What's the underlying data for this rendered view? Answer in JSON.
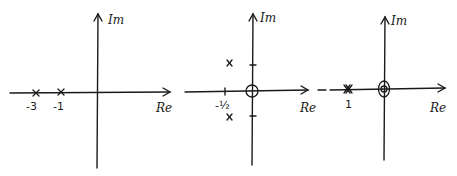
{
  "figure": {
    "type": "pole-zero plots (s-plane)",
    "plots": [
      {
        "id": "plot-1",
        "axis_labels": {
          "imag": "Im",
          "real": "Re"
        },
        "poles": [
          {
            "re": -3,
            "im": 0,
            "label": "-3"
          },
          {
            "re": -1,
            "im": 0,
            "label": "-1"
          }
        ],
        "zeros": []
      },
      {
        "id": "plot-2",
        "axis_labels": {
          "imag": "Im",
          "real": "Re"
        },
        "poles": [
          {
            "re": -0.5,
            "im": 1,
            "label": "x"
          },
          {
            "re": -0.5,
            "im": -1,
            "label": "x"
          }
        ],
        "zeros": [
          {
            "re": 0,
            "im": 0
          }
        ],
        "real_tick_label": "-½"
      },
      {
        "id": "plot-3",
        "axis_labels": {
          "imag": "Im",
          "real": "Re"
        },
        "poles": [
          {
            "re": 1,
            "im": 0,
            "label": "1",
            "multiplicity": 2
          }
        ],
        "zeros": [
          {
            "re": 0,
            "im": 0,
            "multiplicity": 2
          }
        ]
      }
    ]
  },
  "labels": {
    "im": "Im",
    "re": "Re",
    "p1_neg3": "-3",
    "p1_neg1": "-1",
    "p2_neg_half": "-½",
    "p3_one": "1"
  }
}
